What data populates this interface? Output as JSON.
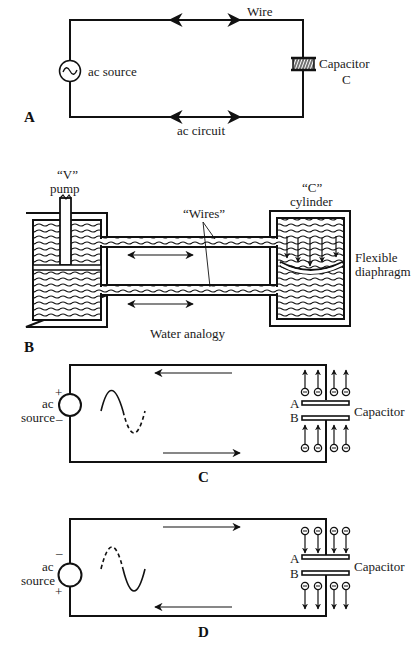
{
  "figure": {
    "panels": {
      "A": {
        "panel_label": "A",
        "wire_label": "Wire",
        "source_label": "ac source",
        "capacitor_label": "Capacitor",
        "capacitor_symbol": "C",
        "caption": "ac circuit"
      },
      "B": {
        "panel_label": "B",
        "pump_label_line1": "“V”",
        "pump_label_line2": "pump",
        "cylinder_label_line1": "“C”",
        "cylinder_label_line2": "cylinder",
        "wires_label": "“Wires”",
        "diaphragm_label_line1": "Flexible",
        "diaphragm_label_line2": "diaphragm",
        "caption": "Water analogy"
      },
      "C": {
        "panel_label": "C",
        "source_label_line1": "ac",
        "source_label_line2": "source",
        "polarity_top": "+",
        "polarity_bottom": "–",
        "plate_a": "A",
        "plate_b": "B",
        "capacitor_label": "Capacitor",
        "top_arrow_direction": "left",
        "bottom_arrow_direction": "right",
        "electron_flow": "up"
      },
      "D": {
        "panel_label": "D",
        "source_label_line1": "ac",
        "source_label_line2": "source",
        "polarity_top": "–",
        "polarity_bottom": "+",
        "plate_a": "A",
        "plate_b": "B",
        "capacitor_label": "Capacitor",
        "top_arrow_direction": "right",
        "bottom_arrow_direction": "left",
        "electron_flow": "down"
      }
    },
    "colors": {
      "ink": "#111111",
      "background": "#ffffff"
    }
  }
}
